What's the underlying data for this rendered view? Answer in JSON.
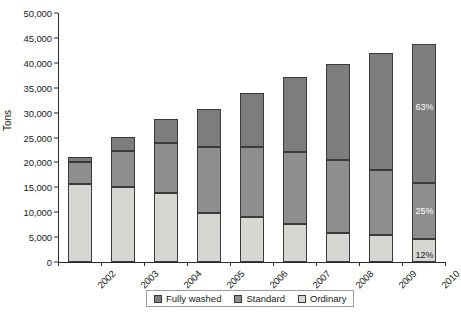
{
  "chart_data": {
    "type": "bar",
    "subtype": "stacked-vertical",
    "title": "",
    "xlabel": "",
    "ylabel": "Tons",
    "ylim": [
      0,
      50000
    ],
    "ytick_step": 5000,
    "ytick_labels": [
      "0",
      "5,000",
      "10,000",
      "15,000",
      "20,000",
      "25,000",
      "30,000",
      "35,000",
      "40,000",
      "45,000",
      "50,000"
    ],
    "ytick_values": [
      0,
      5000,
      10000,
      15000,
      20000,
      25000,
      30000,
      35000,
      40000,
      45000,
      50000
    ],
    "grid": false,
    "legend_position": "bottom",
    "categories": [
      "2002",
      "2003",
      "2004",
      "2005",
      "2006",
      "2007",
      "2008",
      "2009",
      "2010"
    ],
    "stack_order_bottom_to_top": [
      "Ordinary",
      "Standard",
      "Fully washed"
    ],
    "series": [
      {
        "name": "Ordinary",
        "color": "#d6d6d2",
        "values": [
          15700,
          15100,
          13900,
          9900,
          9000,
          7700,
          5800,
          5500,
          4700
        ]
      },
      {
        "name": "Standard",
        "color": "#8e8e8e",
        "values": [
          4400,
          7200,
          9900,
          13200,
          14100,
          14400,
          14700,
          12900,
          11200
        ]
      },
      {
        "name": "Fully washed",
        "color": "#7d7d7d",
        "values": [
          900,
          2900,
          4900,
          7700,
          10800,
          15100,
          19200,
          23600,
          27900
        ]
      }
    ],
    "totals": [
      21000,
      25200,
      28700,
      30800,
      33900,
      37200,
      39700,
      42000,
      43800
    ],
    "annotations": [
      {
        "category": "2010",
        "series": "Fully washed",
        "text": "63%"
      },
      {
        "category": "2010",
        "series": "Standard",
        "text": "25%"
      },
      {
        "category": "2010",
        "series": "Ordinary",
        "text": "12%"
      }
    ]
  },
  "legend": {
    "items": [
      {
        "label": "Fully washed",
        "color": "#7d7d7d"
      },
      {
        "label": "Standard",
        "color": "#8e8e8e"
      },
      {
        "label": "Ordinary",
        "color": "#d6d6d2"
      }
    ]
  }
}
